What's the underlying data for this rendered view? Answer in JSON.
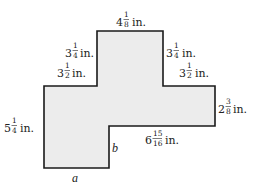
{
  "figure": {
    "shape": {
      "fill": "#ececec",
      "stroke": "#1a1a1a",
      "points": [
        [
          97,
          31
        ],
        [
          163,
          31
        ],
        [
          163,
          86
        ],
        [
          215,
          86
        ],
        [
          215,
          126
        ],
        [
          109,
          126
        ],
        [
          109,
          168
        ],
        [
          44,
          168
        ],
        [
          44,
          86
        ],
        [
          97,
          86
        ]
      ]
    },
    "labels": {
      "top": {
        "whole": "4",
        "num": "1",
        "den": "8",
        "unit": "in."
      },
      "left_upper_vertical": {
        "whole": "3",
        "num": "1",
        "den": "4",
        "unit": "in."
      },
      "left_step_horizontal": {
        "whole": "3",
        "num": "1",
        "den": "2",
        "unit": "in."
      },
      "right_upper_vertical": {
        "whole": "3",
        "num": "1",
        "den": "4",
        "unit": "in."
      },
      "right_step_horizontal": {
        "whole": "3",
        "num": "1",
        "den": "2",
        "unit": "in."
      },
      "right_vertical": {
        "whole": "2",
        "num": "3",
        "den": "8",
        "unit": "in."
      },
      "left_vertical": {
        "whole": "5",
        "num": "1",
        "den": "4",
        "unit": "in."
      },
      "bottom_right_horizontal": {
        "whole": "6",
        "num": "15",
        "den": "16",
        "unit": "in."
      },
      "notch_vertical": {
        "text": "b"
      },
      "bottom_horizontal": {
        "text": "a"
      }
    }
  }
}
